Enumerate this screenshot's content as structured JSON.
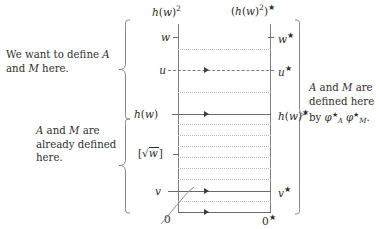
{
  "figure": {
    "type": "commutative-ladder-diagram",
    "headers": {
      "left_column": "h(w)²",
      "right_column": "(h(w)²)*"
    },
    "rows": [
      {
        "id": "w",
        "left": "w",
        "right": "w*",
        "connector": "none",
        "y": 37
      },
      {
        "id": "u",
        "left": "u",
        "right": "u*",
        "connector": "dashed",
        "y": 70
      },
      {
        "id": "hw",
        "left": "h(w)",
        "right": "h(w)*",
        "connector": "solid",
        "y": 114
      },
      {
        "id": "sqrtw",
        "left": "[√w]",
        "right": "",
        "connector": "none",
        "y": 154
      },
      {
        "id": "v",
        "left": "v",
        "right": "v*",
        "connector": "solid",
        "y": 191
      },
      {
        "id": "zero",
        "left": "0",
        "right": "0*",
        "connector": "solid",
        "y": 212
      }
    ],
    "dotted_rows_between_hw_and_zero": 7,
    "annotations": {
      "left_top": "We want to define A and M here.",
      "left_bottom": "A and M are already defined here.",
      "right": "A and M are defined here by φ*ₐ φ*ₘ."
    },
    "colors": {
      "ink": "#2b2b2b",
      "rule": "#6a6a6a",
      "dotted": "#b9b9b9",
      "brace": "#6d6d6d",
      "background": "#ffffff"
    }
  }
}
